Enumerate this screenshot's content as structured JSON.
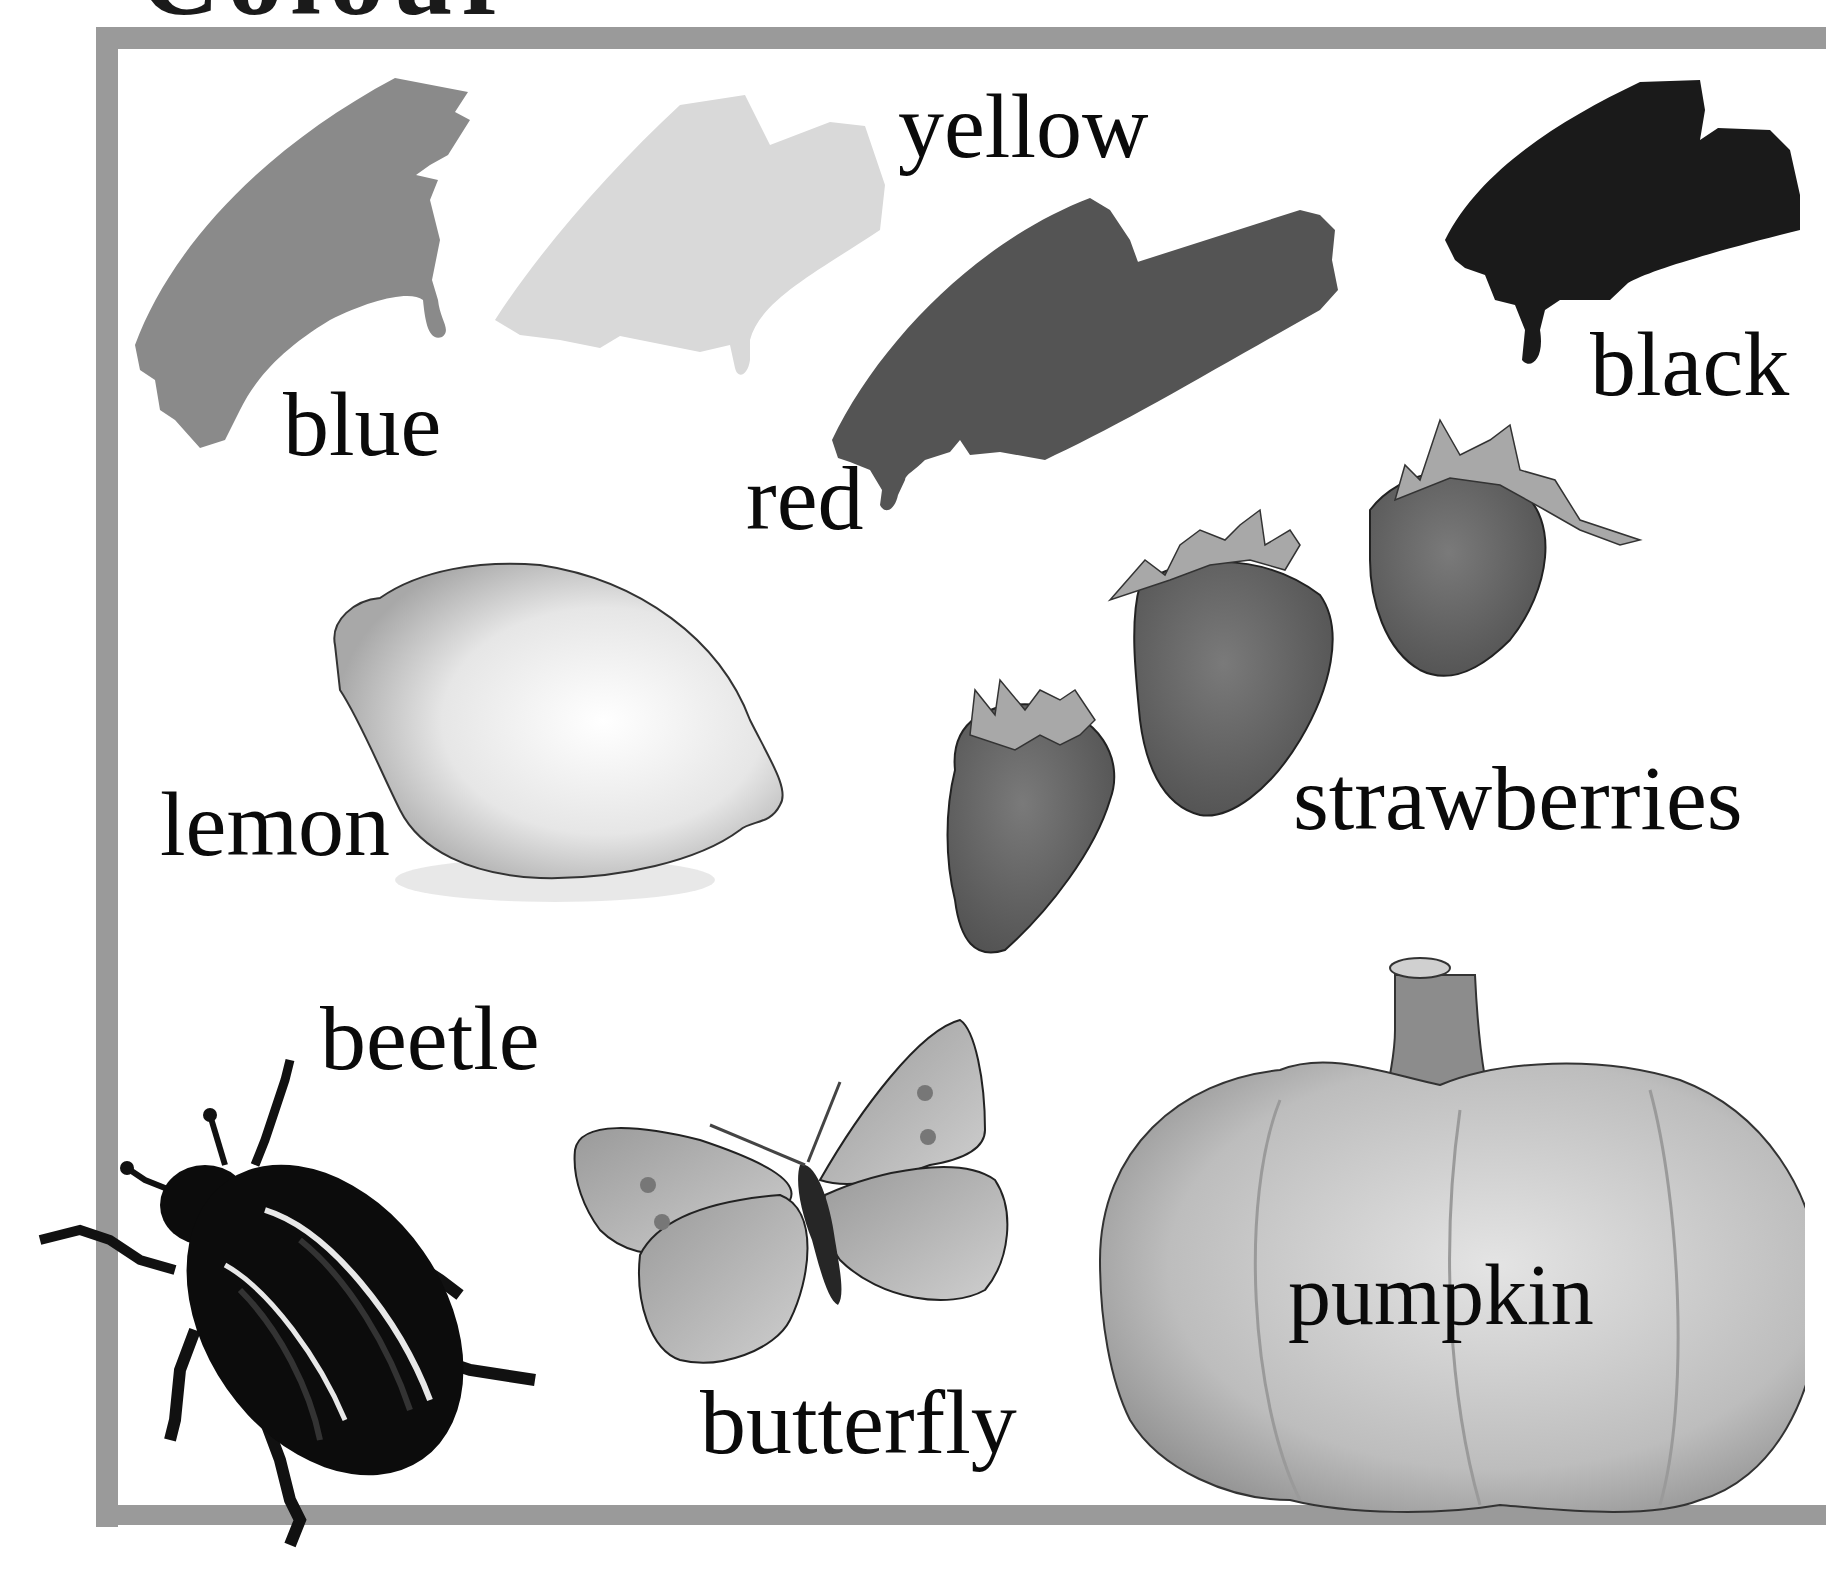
{
  "page": {
    "title_partial": "Colour",
    "theme_colors": {
      "frame": "#9a9a9a",
      "text": "#0a0a0a",
      "background": "#ffffff"
    }
  },
  "paint_swatches": [
    {
      "id": "blue",
      "label": "blue",
      "shade": "#8a8a8a"
    },
    {
      "id": "yellow",
      "label": "yellow",
      "shade": "#d9d9d9"
    },
    {
      "id": "red",
      "label": "red",
      "shade": "#545454"
    },
    {
      "id": "black",
      "label": "black",
      "shade": "#1a1a1a"
    }
  ],
  "objects": [
    {
      "id": "lemon",
      "label": "lemon"
    },
    {
      "id": "strawberries",
      "label": "strawberries"
    },
    {
      "id": "beetle",
      "label": "beetle"
    },
    {
      "id": "butterfly",
      "label": "butterfly"
    },
    {
      "id": "pumpkin",
      "label": "pumpkin"
    }
  ]
}
